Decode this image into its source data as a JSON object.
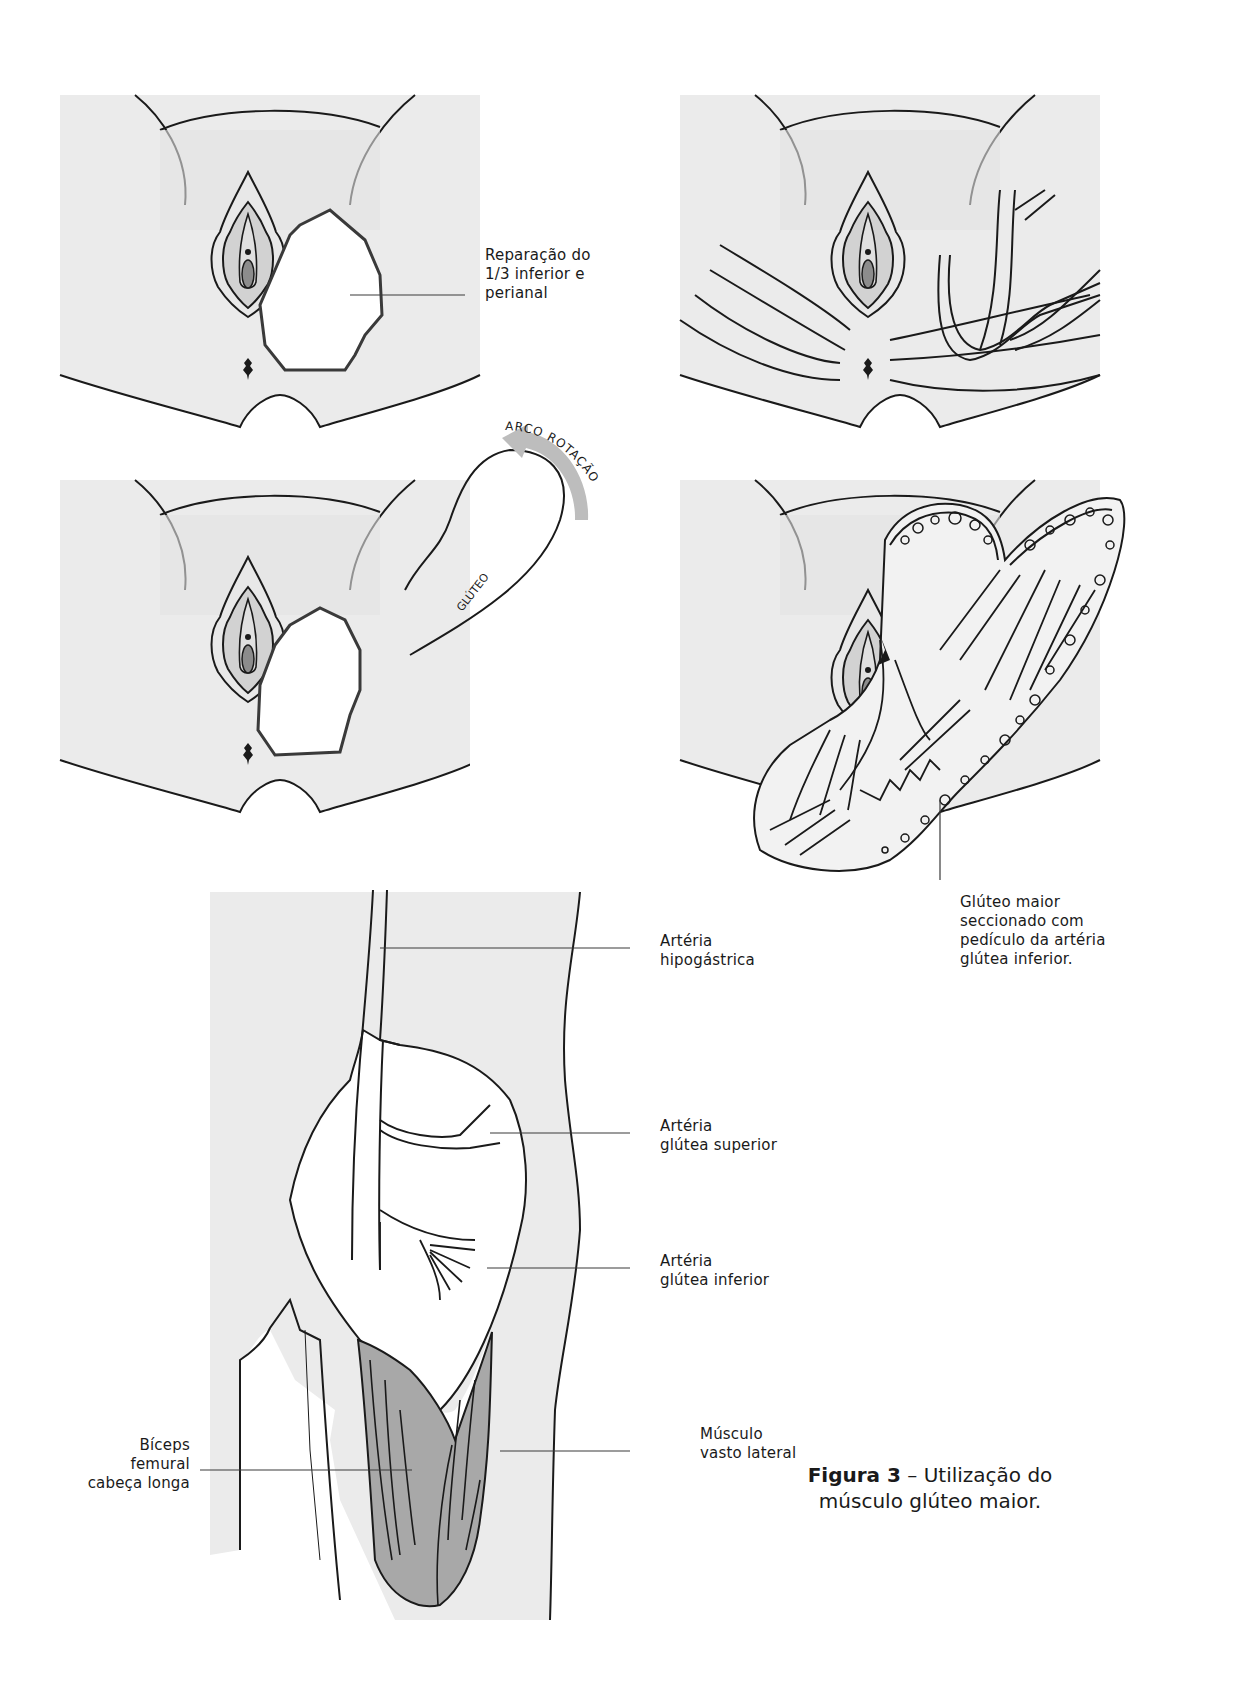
{
  "figure": {
    "caption": {
      "number": "Figura 3",
      "separator": " – ",
      "text_line1": "Utilização do",
      "text_line2": "músculo glúteo maior."
    },
    "panels": [
      {
        "id": "panel-1",
        "description": "Defect of lower third and perianal region"
      },
      {
        "id": "panel-2",
        "description": "Skin tension lines and gluteal vessels"
      },
      {
        "id": "panel-3",
        "description": "Gluteal flap rotation arc"
      },
      {
        "id": "panel-4",
        "description": "Gluteus maximus flap rotated into defect"
      },
      {
        "id": "panel-5",
        "description": "Posterior thigh anatomy with arteries"
      }
    ],
    "labels": {
      "reparacao": [
        "Reparação do",
        "1/3 inferior e",
        "perianal"
      ],
      "arco_rotacao": "ARCO ROTAÇÃO",
      "gluteo": "GLÚTEO",
      "gluteo_maior": [
        "Glúteo maior",
        "seccionado com",
        "pedículo da artéria",
        "glútea inferior."
      ],
      "arteria_hipogastrica": [
        "Artéria",
        "hipogástrica"
      ],
      "arteria_glutea_superior": [
        "Artéria",
        "glútea superior"
      ],
      "arteria_glutea_inferior": [
        "Artéria",
        "glútea inferior"
      ],
      "biceps_femural": [
        "Bíceps",
        "femural",
        "cabeça longa"
      ],
      "musculo_vasto_lateral": [
        "Músculo",
        "vasto lateral"
      ]
    },
    "colors": {
      "skin_fill": "#ebebeb",
      "muscle_fill": "#a8a8a8",
      "arrow_fill": "#bdbdbd",
      "line": "#1a1a1a"
    }
  }
}
